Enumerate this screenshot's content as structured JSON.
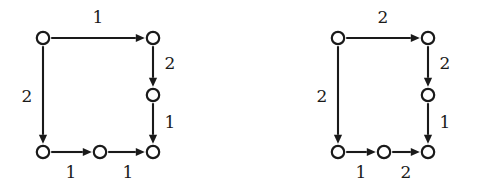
{
  "figure": {
    "kind": "directed-graph-pair",
    "background_color": "#ffffff",
    "ink_color": "#1a1a1a"
  },
  "diagrams": [
    {
      "id": "left",
      "name": "left-graph",
      "nodes": [
        {
          "id": "tl",
          "name": "node-top-left",
          "cx": 43,
          "cy": 38
        },
        {
          "id": "tr",
          "name": "node-top-right",
          "cx": 153,
          "cy": 38
        },
        {
          "id": "mr",
          "name": "node-middle-right",
          "cx": 153,
          "cy": 95
        },
        {
          "id": "bl",
          "name": "node-bottom-left",
          "cx": 43,
          "cy": 152
        },
        {
          "id": "bm",
          "name": "node-bottom-middle",
          "cx": 100,
          "cy": 152
        },
        {
          "id": "br",
          "name": "node-bottom-right",
          "cx": 153,
          "cy": 152
        }
      ],
      "edges": [
        {
          "id": "tl-tr",
          "name": "edge-top",
          "from": "tl",
          "to": "tr",
          "label": "1",
          "label_x": 98,
          "label_y": 18,
          "direction": "right"
        },
        {
          "id": "tl-bl",
          "name": "edge-left",
          "from": "tl",
          "to": "bl",
          "label": "2",
          "label_x": 27,
          "label_y": 97,
          "direction": "down"
        },
        {
          "id": "tr-mr",
          "name": "edge-right-upper",
          "from": "tr",
          "to": "mr",
          "label": "2",
          "label_x": 170,
          "label_y": 64,
          "direction": "down"
        },
        {
          "id": "mr-br",
          "name": "edge-right-lower",
          "from": "mr",
          "to": "br",
          "label": "1",
          "label_x": 170,
          "label_y": 123,
          "direction": "down"
        },
        {
          "id": "bl-bm",
          "name": "edge-bottom-left",
          "from": "bl",
          "to": "bm",
          "label": "1",
          "label_x": 71,
          "label_y": 173,
          "direction": "right"
        },
        {
          "id": "bm-br",
          "name": "edge-bottom-right",
          "from": "bm",
          "to": "br",
          "label": "1",
          "label_x": 128,
          "label_y": 173,
          "direction": "right"
        }
      ]
    },
    {
      "id": "right",
      "name": "right-graph",
      "nodes": [
        {
          "id": "tl",
          "name": "node-top-left",
          "cx": 94,
          "cy": 38
        },
        {
          "id": "tr",
          "name": "node-top-right",
          "cx": 184,
          "cy": 38
        },
        {
          "id": "mr",
          "name": "node-middle-right",
          "cx": 184,
          "cy": 95
        },
        {
          "id": "bl",
          "name": "node-bottom-left",
          "cx": 94,
          "cy": 152
        },
        {
          "id": "bm",
          "name": "node-bottom-middle",
          "cx": 140,
          "cy": 152
        },
        {
          "id": "br",
          "name": "node-bottom-right",
          "cx": 184,
          "cy": 152
        }
      ],
      "edges": [
        {
          "id": "tl-tr",
          "name": "edge-top",
          "from": "tl",
          "to": "tr",
          "label": "2",
          "label_x": 139,
          "label_y": 18,
          "direction": "right"
        },
        {
          "id": "tl-bl",
          "name": "edge-left",
          "from": "tl",
          "to": "bl",
          "label": "2",
          "label_x": 78,
          "label_y": 97,
          "direction": "down"
        },
        {
          "id": "tr-mr",
          "name": "edge-right-upper",
          "from": "tr",
          "to": "mr",
          "label": "2",
          "label_x": 201,
          "label_y": 64,
          "direction": "down"
        },
        {
          "id": "mr-br",
          "name": "edge-right-lower",
          "from": "mr",
          "to": "br",
          "label": "1",
          "label_x": 201,
          "label_y": 123,
          "direction": "down"
        },
        {
          "id": "bl-bm",
          "name": "edge-bottom-left",
          "from": "bl",
          "to": "bm",
          "label": "1",
          "label_x": 117,
          "label_y": 173,
          "direction": "right"
        },
        {
          "id": "bm-br",
          "name": "edge-bottom-right",
          "from": "bm",
          "to": "br",
          "label": "2",
          "label_x": 162,
          "label_y": 173,
          "direction": "right"
        }
      ]
    }
  ]
}
